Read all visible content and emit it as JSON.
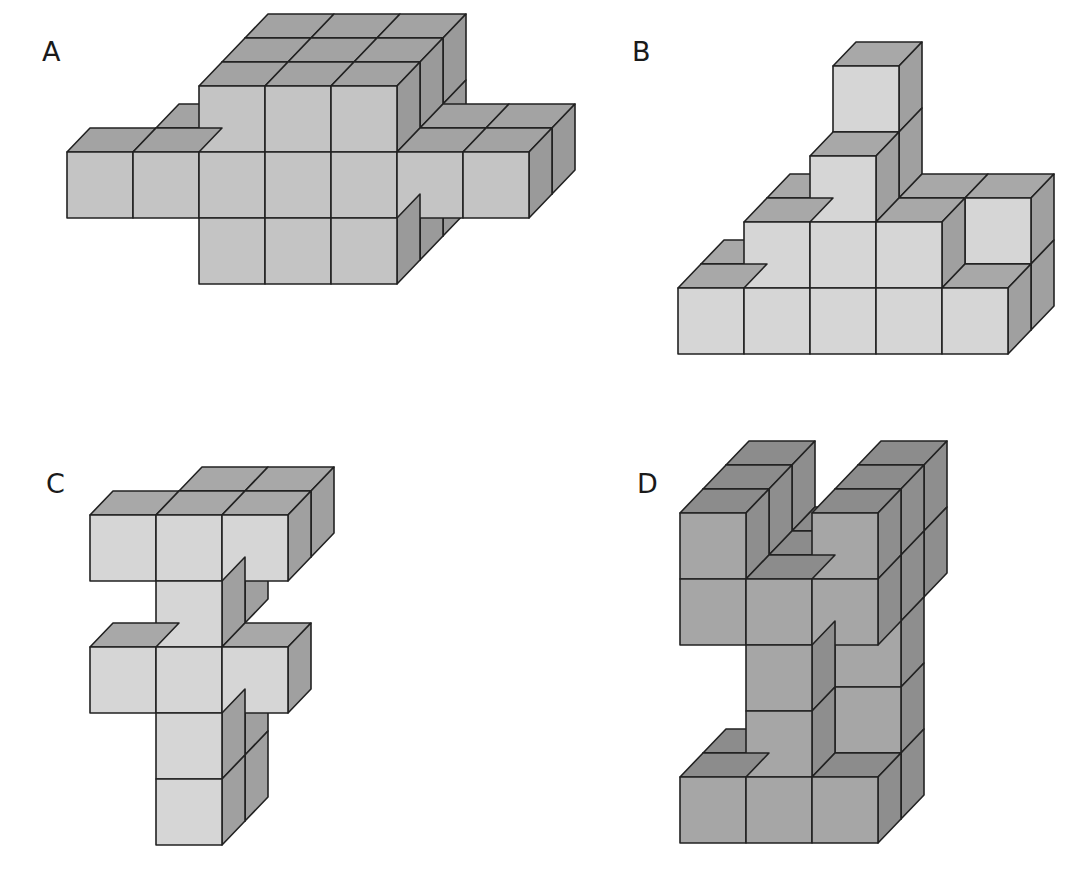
{
  "figure": {
    "panels": [
      {
        "id": "A",
        "label": "A",
        "label_pos": [
          42,
          38
        ],
        "shade": "light-mid"
      },
      {
        "id": "B",
        "label": "B",
        "label_pos": [
          632,
          38
        ],
        "shade": "light"
      },
      {
        "id": "C",
        "label": "C",
        "label_pos": [
          46,
          470
        ],
        "shade": "light"
      },
      {
        "id": "D",
        "label": "D",
        "label_pos": [
          637,
          470
        ],
        "shade": "dark"
      }
    ]
  },
  "style": {
    "cell": 66,
    "depth_dx": 23,
    "depth_dy": -24,
    "stroke": "#222222",
    "palettes": {
      "light-mid": {
        "front": "#c4c4c4",
        "top": "#a3a3a3",
        "side": "#9a9a9a"
      },
      "light": {
        "front": "#d6d6d6",
        "top": "#a8a8a8",
        "side": "#a0a0a0"
      },
      "dark": {
        "front": "#a6a6a6",
        "top": "#8c8c8c",
        "side": "#8e8e8e"
      }
    }
  },
  "cubes": {
    "A": {
      "origin": [
        67,
        152
      ],
      "list": [
        [
          2,
          -1,
          2
        ],
        [
          3,
          -1,
          2
        ],
        [
          4,
          -1,
          2
        ],
        [
          2,
          0,
          2
        ],
        [
          3,
          0,
          2
        ],
        [
          4,
          0,
          2
        ],
        [
          2,
          1,
          2
        ],
        [
          3,
          1,
          2
        ],
        [
          4,
          1,
          2
        ],
        [
          1,
          0,
          1
        ],
        [
          5,
          0,
          1
        ],
        [
          6,
          0,
          1
        ],
        [
          2,
          -1,
          1
        ],
        [
          3,
          -1,
          1
        ],
        [
          4,
          -1,
          1
        ],
        [
          2,
          0,
          1
        ],
        [
          3,
          0,
          1
        ],
        [
          4,
          0,
          1
        ],
        [
          2,
          1,
          1
        ],
        [
          3,
          1,
          1
        ],
        [
          4,
          1,
          1
        ],
        [
          0,
          0,
          0
        ],
        [
          1,
          0,
          0
        ],
        [
          2,
          0,
          0
        ],
        [
          3,
          0,
          0
        ],
        [
          4,
          0,
          0
        ],
        [
          5,
          0,
          0
        ],
        [
          6,
          0,
          0
        ],
        [
          2,
          -1,
          0
        ],
        [
          3,
          -1,
          0
        ],
        [
          4,
          -1,
          0
        ],
        [
          2,
          1,
          0
        ],
        [
          3,
          1,
          0
        ],
        [
          4,
          1,
          0
        ]
      ]
    },
    "B": {
      "origin": [
        678,
        288
      ],
      "list": [
        [
          2,
          -3,
          1
        ],
        [
          2,
          -2,
          1
        ],
        [
          1,
          -1,
          1
        ],
        [
          3,
          -1,
          1
        ],
        [
          4,
          -1,
          1
        ],
        [
          0,
          0,
          1
        ],
        [
          4,
          0,
          1
        ],
        [
          2,
          -2,
          0
        ],
        [
          1,
          -1,
          0
        ],
        [
          2,
          -1,
          0
        ],
        [
          3,
          -1,
          0
        ],
        [
          0,
          0,
          0
        ],
        [
          1,
          0,
          0
        ],
        [
          2,
          0,
          0
        ],
        [
          3,
          0,
          0
        ],
        [
          4,
          0,
          0
        ]
      ]
    },
    "C": {
      "origin": [
        90,
        515
      ],
      "list": [
        [
          1,
          0,
          1
        ],
        [
          2,
          0,
          1
        ],
        [
          1,
          1,
          1
        ],
        [
          1,
          4,
          1
        ],
        [
          1,
          3,
          1
        ],
        [
          0,
          0,
          0
        ],
        [
          1,
          0,
          0
        ],
        [
          2,
          0,
          0
        ],
        [
          1,
          1,
          0
        ],
        [
          0,
          2,
          0
        ],
        [
          1,
          2,
          0
        ],
        [
          2,
          2,
          0
        ],
        [
          1,
          3,
          0
        ],
        [
          1,
          4,
          0
        ]
      ]
    },
    "D": {
      "origin": [
        680,
        513
      ],
      "list": [
        [
          0,
          0,
          2
        ],
        [
          2,
          0,
          2
        ],
        [
          0,
          1,
          2
        ],
        [
          1,
          1,
          2
        ],
        [
          2,
          1,
          2
        ],
        [
          0,
          0,
          1
        ],
        [
          2,
          0,
          1
        ],
        [
          1,
          1,
          1
        ],
        [
          2,
          1,
          1
        ],
        [
          2,
          2,
          1
        ],
        [
          2,
          3,
          1
        ],
        [
          0,
          4,
          1
        ],
        [
          2,
          4,
          1
        ],
        [
          0,
          0,
          0
        ],
        [
          2,
          0,
          0
        ],
        [
          0,
          1,
          0
        ],
        [
          1,
          1,
          0
        ],
        [
          2,
          1,
          0
        ],
        [
          1,
          2,
          0
        ],
        [
          1,
          3,
          0
        ],
        [
          0,
          4,
          0
        ],
        [
          1,
          4,
          0
        ],
        [
          2,
          4,
          0
        ]
      ]
    }
  }
}
